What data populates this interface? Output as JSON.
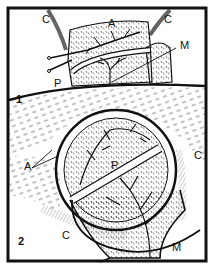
{
  "figure": {
    "panels": [
      {
        "number": "1",
        "labels": {
          "c_left": "C",
          "a": "A",
          "c_right": "C",
          "m": "M",
          "p": "P"
        }
      },
      {
        "number": "2",
        "labels": {
          "a": "A",
          "p": "P",
          "c_right": "C",
          "c_bottom": "C",
          "m": "M"
        }
      }
    ],
    "colors": {
      "ink": "#111111",
      "paper": "#ffffff"
    }
  }
}
